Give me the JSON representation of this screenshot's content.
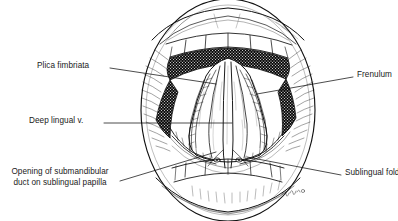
{
  "figure": {
    "kind": "anatomical-illustration",
    "background_color": "#ffffff",
    "ink_color": "#111111",
    "line_style": "pen-and-ink line drawing with stipple and cross-hatch shading",
    "signature_present": true
  },
  "labels": [
    {
      "id": "plica-fimbriata",
      "text": "Plica fimbriata",
      "side": "left",
      "lines": [
        "Plica fimbriata"
      ],
      "text_x": 37,
      "text_y": 61,
      "leader": {
        "x1": 110,
        "y1": 68,
        "x2": 216,
        "y2": 84
      }
    },
    {
      "id": "deep-lingual-vein",
      "text": "Deep lingual v.",
      "side": "left",
      "lines": [
        "Deep lingual v."
      ],
      "text_x": 29,
      "text_y": 116,
      "leader": {
        "x1": 104,
        "y1": 123,
        "x2": 232,
        "y2": 123
      }
    },
    {
      "id": "submandibular-duct-opening",
      "text": "Opening of submandibular duct on sublingual papilla",
      "side": "left",
      "lines": [
        "Opening of submandibular",
        "duct on sublingual papilla"
      ],
      "text_x": 4,
      "text_y": 167,
      "leader": {
        "x1": 120,
        "y1": 181,
        "x2": 216,
        "y2": 152
      }
    },
    {
      "id": "frenulum",
      "text": "Frenulum",
      "side": "right",
      "lines": [
        "Frenulum"
      ],
      "text_x": 357,
      "text_y": 70,
      "leader": {
        "x1": 353,
        "y1": 77,
        "x2": 257,
        "y2": 94
      }
    },
    {
      "id": "sublingual-fold",
      "text": "Sublingual fold",
      "side": "right",
      "lines": [
        "Sublingual fold"
      ],
      "text_x": 345,
      "text_y": 168,
      "leader": {
        "x1": 341,
        "y1": 175,
        "x2": 247,
        "y2": 157
      }
    }
  ]
}
